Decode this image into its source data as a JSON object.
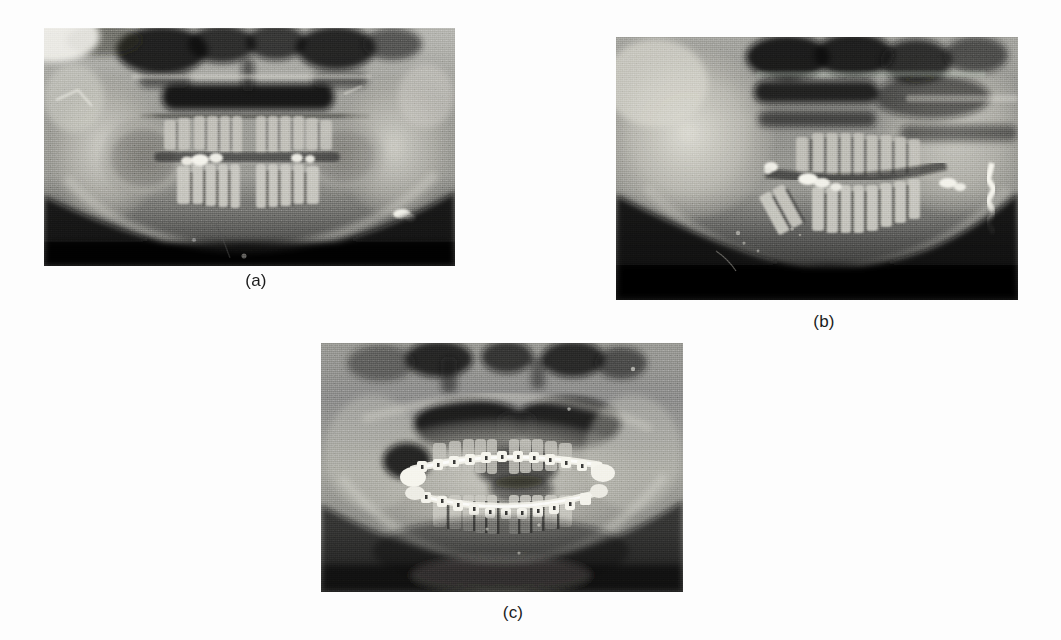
{
  "figure": {
    "background_color": "#fdfdfd",
    "kind": "multi-panel radiograph figure",
    "panel_count": 3
  },
  "panels": [
    {
      "id": "panel-a",
      "caption": "(a)",
      "modality": "panoramic dental radiograph",
      "description": "Panoramic radiograph of the jaws showing maxillary and mandibular dentition with a radiolucent lesion in the left body of the mandible",
      "x": 44,
      "y": 28,
      "width": 411,
      "height": 238,
      "caption_center_x": 256,
      "caption_y": 271,
      "base_color": "#8f8f8f"
    },
    {
      "id": "panel-b",
      "caption": "(b)",
      "modality": "panoramic dental radiograph",
      "description": "Panoramic radiograph showing the jaws after resection with remaining dentition and bone margins",
      "x": 616,
      "y": 37,
      "width": 402,
      "height": 263,
      "caption_center_x": 824,
      "caption_y": 312,
      "base_color": "#8b8b8b"
    },
    {
      "id": "panel-c",
      "caption": "(c)",
      "modality": "panoramic dental radiograph",
      "description": "Panoramic radiograph showing fixed orthodontic appliance with brackets and archwires on both maxillary and mandibular arches",
      "x": 321,
      "y": 343,
      "width": 362,
      "height": 249,
      "caption_center_x": 513,
      "caption_y": 603,
      "base_color": "#949494"
    }
  ],
  "colors": {
    "page_background": "#fdfdfd",
    "caption_text": "#1b1b1b",
    "film_dark": "#0d0d0d",
    "film_mid": "#8f8f8f",
    "film_bright": "#f0efe9"
  }
}
